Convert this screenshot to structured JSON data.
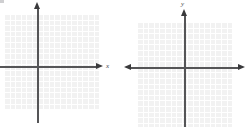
{
  "figure": {
    "background_color": "#ffffff",
    "grid_color": "#f2f2f2",
    "grid_line_color": "#ffffff",
    "axis_color": "#555557",
    "arrow_color": "#3a3a3c",
    "label_color": "#4a4a4c"
  },
  "charts": [
    {
      "id": "left-plane",
      "name": "left-coordinate-plane",
      "type": "scatter",
      "title": "",
      "xlabel": "x",
      "ylabel": "",
      "axis_labels": {
        "x": "x",
        "y": ""
      },
      "xlim": [
        -6,
        11
      ],
      "ylim": [
        -9,
        9
      ],
      "grid": true,
      "grid_spacing": 1,
      "x_axis_arrows": [
        "right"
      ],
      "y_axis_arrows": [
        "up"
      ],
      "series": [],
      "annotations": []
    },
    {
      "id": "right-plane",
      "name": "right-coordinate-plane",
      "type": "scatter",
      "title": "",
      "xlabel": "",
      "ylabel": "y",
      "axis_labels": {
        "x": "",
        "y": "y"
      },
      "xlim": [
        -9,
        9
      ],
      "ylim": [
        -11,
        8
      ],
      "grid": true,
      "grid_spacing": 1,
      "x_axis_arrows": [
        "left",
        "right"
      ],
      "y_axis_arrows": [
        "up"
      ],
      "series": [],
      "annotations": []
    }
  ],
  "chart_data": {
    "type": "scatter",
    "title": "",
    "xlabel": "x",
    "ylabel": "y",
    "grid": true,
    "legend": null,
    "panels": [
      {
        "name": "left",
        "xlabel": "x",
        "ylabel": "",
        "xlim": [
          -6,
          11
        ],
        "ylim": [
          -9,
          9
        ],
        "x": [],
        "y": [],
        "values": []
      },
      {
        "name": "right",
        "xlabel": "",
        "ylabel": "y",
        "xlim": [
          -9,
          9
        ],
        "ylim": [
          -11,
          8
        ],
        "x": [],
        "y": [],
        "values": []
      }
    ]
  }
}
